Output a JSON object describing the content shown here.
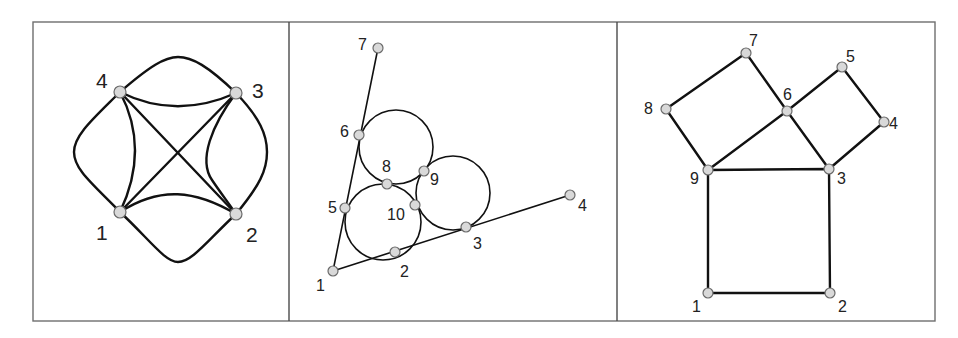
{
  "figure": {
    "panel_count": 3,
    "colors": {
      "edge": "#111111",
      "node_fill": "#d9d9d9",
      "node_stroke": "#6a6a6a",
      "frame": "#6e6e6e"
    }
  },
  "panels": [
    {
      "id": "left",
      "description": "Complete multigraph on 4 nodes with curved and straight edges",
      "nodes": [
        {
          "label": "1",
          "x": 120,
          "y": 212
        },
        {
          "label": "2",
          "x": 236,
          "y": 214
        },
        {
          "label": "3",
          "x": 236,
          "y": 93
        },
        {
          "label": "4",
          "x": 120,
          "y": 92
        }
      ]
    },
    {
      "id": "middle",
      "description": "Three mutually tangent circles inscribed in an angle",
      "nodes": [
        {
          "label": "1",
          "x": 333,
          "y": 271
        },
        {
          "label": "2",
          "x": 395,
          "y": 252
        },
        {
          "label": "3",
          "x": 466,
          "y": 227
        },
        {
          "label": "4",
          "x": 570,
          "y": 195
        },
        {
          "label": "5",
          "x": 345,
          "y": 208
        },
        {
          "label": "6",
          "x": 359,
          "y": 135
        },
        {
          "label": "7",
          "x": 378,
          "y": 48
        },
        {
          "label": "8",
          "x": 387,
          "y": 184
        },
        {
          "label": "9",
          "x": 424,
          "y": 171
        },
        {
          "label": "10",
          "x": 415,
          "y": 205
        }
      ]
    },
    {
      "id": "right",
      "description": "Pythagorean configuration: squares on the sides of a right triangle",
      "nodes": [
        {
          "label": "1",
          "x": 708,
          "y": 293
        },
        {
          "label": "2",
          "x": 830,
          "y": 293
        },
        {
          "label": "3",
          "x": 829,
          "y": 169
        },
        {
          "label": "4",
          "x": 884,
          "y": 122
        },
        {
          "label": "5",
          "x": 842,
          "y": 67
        },
        {
          "label": "6",
          "x": 787,
          "y": 111
        },
        {
          "label": "7",
          "x": 746,
          "y": 53
        },
        {
          "label": "8",
          "x": 666,
          "y": 109
        },
        {
          "label": "9",
          "x": 708,
          "y": 170
        }
      ]
    }
  ]
}
